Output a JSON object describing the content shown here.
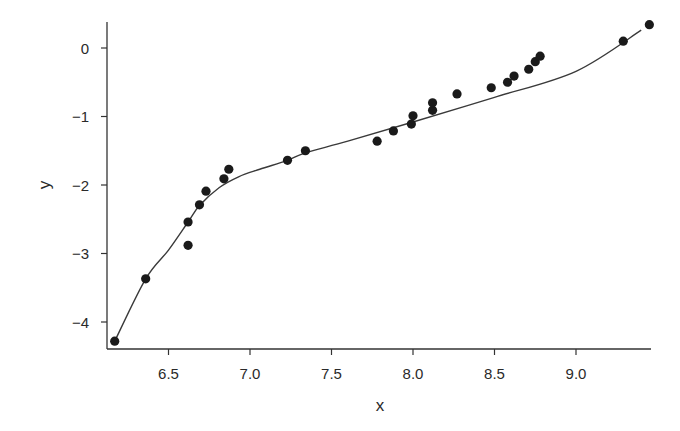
{
  "chart_data": {
    "type": "scatter",
    "title": "",
    "xlabel": "x",
    "ylabel": "y",
    "xlim": [
      6.12,
      9.5
    ],
    "ylim": [
      -4.45,
      0.4
    ],
    "grid": false,
    "legend": null,
    "x_ticks": [
      6.5,
      7.0,
      7.5,
      8.0,
      8.5,
      9.0
    ],
    "x_tick_labels": [
      "6.5",
      "7.0",
      "7.5",
      "8.0",
      "8.5",
      "9.0"
    ],
    "y_ticks": [
      0,
      -1,
      -2,
      -3,
      -4
    ],
    "y_tick_labels": [
      "0",
      "−1",
      "−2",
      "−3",
      "−4"
    ],
    "series": [
      {
        "name": "observations",
        "kind": "points",
        "x": [
          6.17,
          6.36,
          6.62,
          6.62,
          6.69,
          6.73,
          6.84,
          6.87,
          7.23,
          7.34,
          7.78,
          7.88,
          7.99,
          8.0,
          8.12,
          8.12,
          8.27,
          8.48,
          8.58,
          8.62,
          8.71,
          8.75,
          8.78,
          9.29,
          9.45
        ],
        "y": [
          -4.28,
          -3.37,
          -2.54,
          -2.88,
          -2.29,
          -2.09,
          -1.91,
          -1.77,
          -1.64,
          -1.5,
          -1.36,
          -1.21,
          -1.11,
          -0.99,
          -0.91,
          -0.8,
          -0.67,
          -0.58,
          -0.5,
          -0.41,
          -0.31,
          -0.2,
          -0.12,
          0.1,
          0.34
        ]
      },
      {
        "name": "fitted curve",
        "kind": "line",
        "x": [
          6.17,
          6.36,
          6.5,
          6.62,
          6.69,
          6.81,
          6.93,
          7.06,
          7.23,
          7.34,
          7.6,
          8.0,
          8.5,
          9.0,
          9.4
        ],
        "y": [
          -4.28,
          -3.37,
          -2.95,
          -2.54,
          -2.3,
          -2.04,
          -1.88,
          -1.77,
          -1.64,
          -1.53,
          -1.36,
          -1.08,
          -0.72,
          -0.34,
          0.26
        ]
      }
    ]
  },
  "labels": {
    "xlabel": "x",
    "ylabel": "y",
    "x_ticks": [
      "6.5",
      "7.0",
      "7.5",
      "8.0",
      "8.5",
      "9.0"
    ],
    "y_ticks": [
      "0",
      "−1",
      "−2",
      "−3",
      "−4"
    ]
  }
}
